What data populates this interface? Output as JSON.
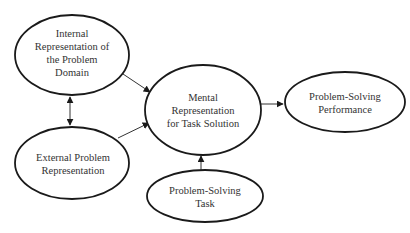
{
  "diagram": {
    "nodes": [
      {
        "id": "internal",
        "lines": [
          "Internal",
          "Representation of",
          "the Problem",
          "Domain"
        ]
      },
      {
        "id": "external",
        "lines": [
          "External Problem",
          "Representation"
        ]
      },
      {
        "id": "mental",
        "lines": [
          "Mental",
          "Representation",
          "for Task Solution"
        ]
      },
      {
        "id": "performance",
        "lines": [
          "Problem-Solving",
          "Performance"
        ]
      },
      {
        "id": "task",
        "lines": [
          "Problem-Solving",
          "Task"
        ]
      }
    ],
    "edges": [
      {
        "from": "internal",
        "to": "external",
        "type": "bidirectional"
      },
      {
        "from": "internal",
        "to": "mental",
        "type": "directed"
      },
      {
        "from": "external",
        "to": "mental",
        "type": "directed"
      },
      {
        "from": "task",
        "to": "mental",
        "type": "directed"
      },
      {
        "from": "mental",
        "to": "performance",
        "type": "directed"
      }
    ]
  }
}
